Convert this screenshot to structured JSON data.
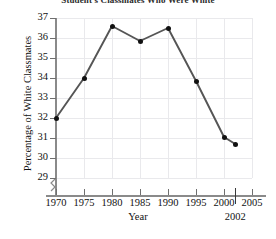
{
  "chart_data": {
    "type": "line",
    "title": "Student's Classmates Who Were White",
    "xlabel": "Year",
    "ylabel": "Percentage of White Classmates",
    "x": [
      1970,
      1975,
      1980,
      1985,
      1990,
      1995,
      2000,
      2002
    ],
    "values": [
      32.0,
      34.0,
      36.6,
      35.85,
      36.5,
      33.85,
      31.05,
      30.7
    ],
    "series": [
      {
        "name": "Percentage of White Classmates",
        "values": [
          32.0,
          34.0,
          36.6,
          35.85,
          36.5,
          33.85,
          31.05,
          30.7
        ]
      }
    ],
    "xlim": [
      1970,
      2005
    ],
    "ylim": [
      29,
      37
    ],
    "xticks": [
      "1970",
      "1975",
      "1980",
      "1985",
      "1990",
      "1995",
      "2000",
      "2005"
    ],
    "xtick_values": [
      1970,
      1975,
      1980,
      1985,
      1990,
      1995,
      2000,
      2005
    ],
    "yticks": [
      "29",
      "30",
      "31",
      "32",
      "33",
      "34",
      "35",
      "36",
      "37"
    ],
    "ytick_values": [
      29,
      30,
      31,
      32,
      33,
      34,
      35,
      36,
      37
    ],
    "grid": true,
    "legend": "none",
    "y_axis_break": true,
    "annotations": [
      {
        "label": "2002",
        "x": 2002
      }
    ],
    "line_color": "#555555",
    "marker_color": "#111111",
    "grid_color": "#e9e9ec",
    "axis_color": "#8a8a8a"
  }
}
